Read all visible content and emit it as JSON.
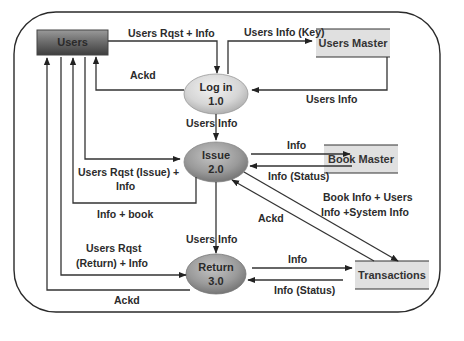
{
  "diagram": {
    "type": "data-flow-diagram",
    "external_entity": {
      "id": "users",
      "label": "Users"
    },
    "processes": [
      {
        "id": "login",
        "name": "Log in",
        "number": "1.0"
      },
      {
        "id": "issue",
        "name": "Issue",
        "number": "2.0"
      },
      {
        "id": "return",
        "name": "Return",
        "number": "3.0"
      }
    ],
    "data_stores": [
      {
        "id": "users_master",
        "label": "Users Master"
      },
      {
        "id": "book_master",
        "label": "Book Master"
      },
      {
        "id": "transactions",
        "label": "Transactions"
      }
    ],
    "flows": [
      {
        "from": "users",
        "to": "login",
        "label": "Users Rqst + Info"
      },
      {
        "from": "login",
        "to": "users",
        "label": "Ackd"
      },
      {
        "from": "login",
        "to": "users_master",
        "label": "Users Info (Key)"
      },
      {
        "from": "users_master",
        "to": "login",
        "label": "Users Info"
      },
      {
        "from": "login",
        "to": "issue",
        "label": "Users Info"
      },
      {
        "from": "users",
        "to": "issue",
        "label_line1": "Users Rqst (Issue) +",
        "label_line2": "Info"
      },
      {
        "from": "issue",
        "to": "users",
        "label": "Info + book"
      },
      {
        "from": "issue",
        "to": "book_master",
        "label": "Info"
      },
      {
        "from": "book_master",
        "to": "issue",
        "label": "Info (Status)"
      },
      {
        "from": "issue",
        "to": "transactions",
        "label_line1": "Book Info + Users",
        "label_line2": "Info +System Info"
      },
      {
        "from": "transactions",
        "to": "issue",
        "label": "Ackd"
      },
      {
        "from": "issue",
        "to": "return",
        "label": "Users Info"
      },
      {
        "from": "users",
        "to": "return",
        "label_line1": "Users Rqst",
        "label_line2": "(Return) + Info"
      },
      {
        "from": "return",
        "to": "users",
        "label": "Ackd"
      },
      {
        "from": "return",
        "to": "transactions",
        "label": "Info"
      },
      {
        "from": "transactions",
        "to": "return",
        "label": "Info (Status)"
      }
    ]
  }
}
